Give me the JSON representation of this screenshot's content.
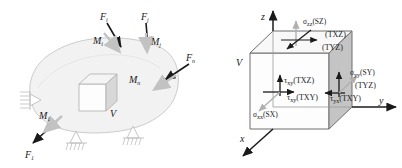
{
  "figure": {
    "background_color": "#ffffff",
    "ink_color": "#1a1a1a",
    "body_fill": "#f2f2f2",
    "body_stroke": "#c9c9c9",
    "arrow_dark": "#1a1a1a",
    "arrow_gray": "#b0b0b0",
    "cube_face_light": "#fefefe",
    "cube_face_top": "#f7f7f7",
    "cube_face_side": "#c4c4c4",
    "cube_edge": "#6e6e6e",
    "support_color": "#b8b8b8"
  },
  "left_panel": {
    "name": "loaded-body-diagram",
    "volume_label": "V",
    "forces": [
      {
        "id": "Fi",
        "base": "F",
        "sub": "i",
        "label": "F"
      },
      {
        "id": "Fj",
        "base": "F",
        "sub": "j",
        "label": "F"
      },
      {
        "id": "Fn",
        "base": "F",
        "sub": "n",
        "label": "F"
      },
      {
        "id": "F1",
        "base": "F",
        "sub": "1",
        "label": "F"
      }
    ],
    "moments": [
      {
        "id": "Mi",
        "base": "M",
        "sub": "i",
        "label": "M"
      },
      {
        "id": "Mj",
        "base": "M",
        "sub": "j",
        "label": "M"
      },
      {
        "id": "Mn",
        "base": "M",
        "sub": "n",
        "label": "M"
      },
      {
        "id": "M1",
        "base": "M",
        "sub": "1",
        "label": "M"
      }
    ],
    "supports": [
      {
        "id": "support-left",
        "type": "pin-support"
      },
      {
        "id": "support-bottom-center",
        "type": "pin-support"
      },
      {
        "id": "support-bottom-right",
        "type": "pin-support"
      }
    ]
  },
  "right_panel": {
    "name": "stress-element-cube",
    "volume_label": "V",
    "axes": [
      {
        "id": "axis-z",
        "label": "z"
      },
      {
        "id": "axis-y",
        "label": "y"
      },
      {
        "id": "axis-x",
        "label": "x"
      }
    ],
    "stress_labels": [
      {
        "id": "sigma-zz",
        "sym": "σ",
        "sub": "zz",
        "code": "(SZ)",
        "color": "#b0b0b0"
      },
      {
        "id": "tau-xz-top",
        "sym": "",
        "sub": "",
        "code": "(TXZ)",
        "color": "#1a1a1a"
      },
      {
        "id": "tau-yz-top",
        "sym": "",
        "sub": "",
        "code": "(TYZ)",
        "color": "#1a1a1a"
      },
      {
        "id": "tau-xy-front-vert",
        "sym": "τ",
        "sub": "xy",
        "code": "(TXZ)",
        "color": "#1a1a1a"
      },
      {
        "id": "tau-xy-front-horz",
        "sym": "τ",
        "sub": "xy",
        "code": "(TXY)",
        "color": "#1a1a1a"
      },
      {
        "id": "sigma-xx",
        "sym": "σ",
        "sub": "xx",
        "code": "(SX)",
        "color": "#b0b0b0"
      },
      {
        "id": "sigma-yy",
        "sym": "σ",
        "sub": "yy",
        "code": "(SY)",
        "color": "#b0b0b0"
      },
      {
        "id": "tau-yz-right",
        "sym": "",
        "sub": "",
        "code": "(TYZ)",
        "color": "#1a1a1a"
      },
      {
        "id": "tau-yx-right",
        "sym": "τ",
        "sub": "yx",
        "code": "(TXY)",
        "color": "#1a1a1a"
      }
    ]
  }
}
